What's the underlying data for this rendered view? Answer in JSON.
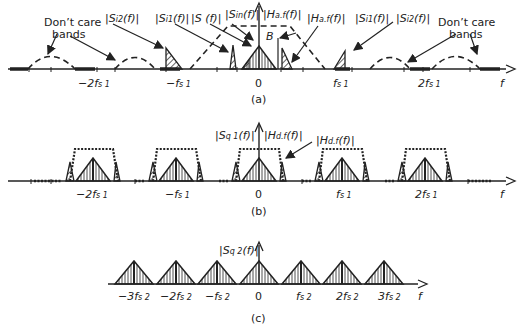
{
  "figure": {
    "panels": [
      {
        "id": "a",
        "caption": "(a)",
        "axis_label": "f",
        "ticks": [
          "−2f",
          "−f",
          "0",
          "f",
          "2f"
        ],
        "tick_labels": {
          "neg2": "−2f",
          "neg1": "−f",
          "zero": "0",
          "pos1": "f",
          "pos2": "2f",
          "sub": "s 1"
        },
        "annotations": {
          "dont_care_left": "Don’t care",
          "dont_care_left2": "bands",
          "dont_care_right": "Don’t care",
          "dont_care_right2": "bands",
          "s_i2_left": "|S",
          "s_i2_left_sub": "i2",
          "s_i2_left_tail": "(f)|",
          "s_i1_left": "|S",
          "s_i1_left_sub": "i1",
          "s_i1_left_tail": "(f)|",
          "s_f": "|S (f)|",
          "s_in": "|S",
          "s_in_sub": "in",
          "s_in_tail": "(f)|",
          "h_af_top": "|H",
          "h_af_top_sub": "a.f",
          "h_af_top_tail": "(f)|",
          "h_af_right": "|H",
          "h_af_right_sub": "a.f",
          "h_af_right_tail": "(f)|",
          "s_i1_right": "|S",
          "s_i1_right_sub": "i1",
          "s_i1_right_tail": "(f)|",
          "s_i2_right": "|S",
          "s_i2_right_sub": "i2",
          "s_i2_right_tail": "(f)|",
          "bandwidth": "B"
        }
      },
      {
        "id": "b",
        "caption": "(b)",
        "axis_label": "f",
        "tick_labels": {
          "neg2": "−2f",
          "neg1": "−f",
          "zero": "0",
          "pos1": "f",
          "pos2": "2f",
          "sub": "s 1"
        },
        "annotations": {
          "s_q1": "|S",
          "s_q1_sub": "q 1",
          "s_q1_tail": "(f)|",
          "h_df_top": "|H",
          "h_df_top_sub": "d.f",
          "h_df_top_tail": "(f)|",
          "h_df_right": "|H",
          "h_df_right_sub": "d.f",
          "h_df_right_tail": "(f)|"
        }
      },
      {
        "id": "c",
        "caption": "(c)",
        "axis_label": "f",
        "tick_labels": {
          "neg3": "−3f",
          "neg2": "−2f",
          "neg1": "−f",
          "zero": "0",
          "pos1": "f",
          "pos2": "2f",
          "pos3": "3f",
          "sub": "s 2"
        },
        "annotations": {
          "s_q2": "|S",
          "s_q2_sub": "q 2",
          "s_q2_tail": "(f)|"
        }
      }
    ]
  }
}
